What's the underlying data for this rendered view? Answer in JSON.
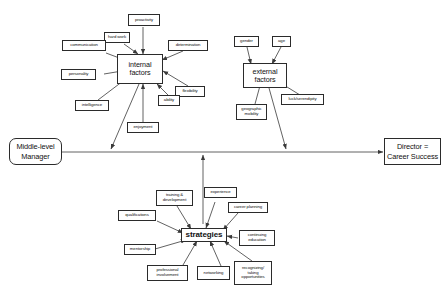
{
  "diagram": {
    "background_color": "#ffffff",
    "line_color": "#3a3a3a",
    "box_border_color": "#2b2b2b",
    "nodes": {
      "middle_level_manager": "Middle-level\nManager",
      "director_career_success": "Director =\nCareer Success",
      "internal_factors": "internal\nfactors",
      "external_factors": "external\nfactors",
      "strategies": "strategies",
      "proactivity": "proactivity",
      "hard_work": "hard work",
      "communication": "communication",
      "personality": "personality",
      "intelligence": "intelligence",
      "enjoyment": "enjoyment",
      "determination": "determination",
      "flexibility": "flexibility",
      "ability": "ability",
      "gender": "gender",
      "age": "age",
      "luck_serendipity": "luck/serendipity",
      "geographic_mobility": "geographic\nmobility",
      "training_development": "training &\ndevelopment",
      "experience": "experience",
      "career_planning": "career planning",
      "qualifications": "qualifications",
      "continuing_education": "continuing\neducation",
      "mentorship": "mentorship",
      "professional_involvement": "professional\ninvolvement",
      "networking": "networking",
      "recognizing_opportunities": "recognizing/\ntaking\nopportunities"
    }
  }
}
